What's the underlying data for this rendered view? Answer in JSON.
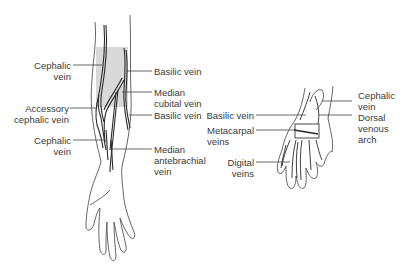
{
  "colors": {
    "shade": "#d9d9d9",
    "stroke": "#2a2a2a",
    "outline": "#555555",
    "leader": "#444444",
    "text": "#3a3a3a"
  },
  "arm": {
    "left_labels": [
      {
        "text": "Cephalic\nvein"
      },
      {
        "text": "Accessory\ncephalic vein"
      },
      {
        "text": "Cephalic\nvein"
      }
    ],
    "right_labels": [
      {
        "text": "Basilic vein"
      },
      {
        "text": "Median\ncubital vein"
      },
      {
        "text": "Basilic vein"
      },
      {
        "text": "Median\nantebrachial\nvein"
      }
    ]
  },
  "hand": {
    "left_labels": [
      {
        "text": "Basilic vein"
      },
      {
        "text": "Metacarpal\nveins"
      },
      {
        "text": "Digital\nveins"
      }
    ],
    "right_labels": [
      {
        "text": "Cephalic\nvein"
      },
      {
        "text": "Dorsal\nvenous\narch"
      }
    ]
  }
}
